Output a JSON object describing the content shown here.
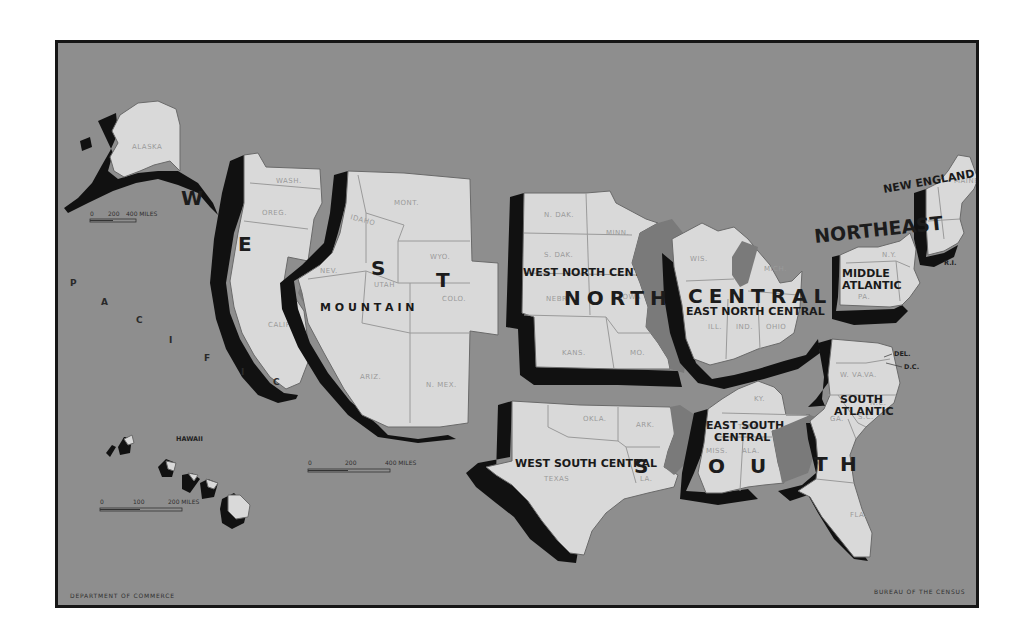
{
  "map": {
    "regions": {
      "west": {
        "label_letters": [
          "W",
          "E",
          "S",
          "T"
        ]
      },
      "north_central": {
        "label_word1": "NORTH",
        "label_word2": "CENTRAL"
      },
      "northeast": {
        "label": "NORTHEAST"
      },
      "south": {
        "label_letters": [
          "S",
          "O",
          "U",
          "T",
          "H"
        ]
      }
    },
    "divisions": {
      "mountain": "M O U N T A I N",
      "pacific_letters": [
        "P",
        "A",
        "C",
        "I",
        "F",
        "I",
        "C"
      ],
      "west_north_central": "WEST NORTH CENTRAL",
      "east_north_central": "EAST NORTH CENTRAL",
      "new_england": "NEW ENGLAND",
      "middle_atlantic_line1": "MIDDLE",
      "middle_atlantic_line2": "ATLANTIC",
      "west_south_central": "WEST SOUTH CENTRAL",
      "east_south_central_line1": "EAST SOUTH",
      "east_south_central_line2": "CENTRAL",
      "south_atlantic_line1": "SOUTH",
      "south_atlantic_line2": "ATLANTIC"
    },
    "states": {
      "alaska": "ALASKA",
      "wash": "WASH.",
      "oreg": "OREG.",
      "calif": "CALIF.",
      "mont": "MONT.",
      "idaho": "IDAHO",
      "wyo": "WYO.",
      "nev": "NEV.",
      "utah": "UTAH",
      "colo": "COLO.",
      "ariz": "ARIZ.",
      "nmex": "N. MEX.",
      "ndak": "N. DAK.",
      "minn": "MINN.",
      "sdak": "S. DAK.",
      "nebr": "NEBR.",
      "iowa": "IOWA",
      "kans": "KANS.",
      "mo": "MO.",
      "wis": "WIS.",
      "mich": "MICH.",
      "ill": "ILL.",
      "ind": "IND.",
      "ohio": "OHIO",
      "ny": "N.Y.",
      "pa": "PA.",
      "nj": "N.J.",
      "maine": "MAINE",
      "ri": "R.I.",
      "okla": "OKLA.",
      "ark": "ARK.",
      "texas": "TEXAS",
      "la": "LA.",
      "ky": "KY.",
      "tenn": "TENN.",
      "miss": "MISS.",
      "ala": "ALA.",
      "va": "VA.",
      "wva": "W. VA.",
      "nc": "N.C.",
      "sc": "S.C.",
      "ga": "GA.",
      "fla": "FLA.",
      "del": "DEL.",
      "dc": "D.C.",
      "hawaii": "HAWAII"
    },
    "scales": {
      "alaska": {
        "ticks": [
          "0",
          "200",
          "400 MILES"
        ]
      },
      "conus": {
        "ticks": [
          "0",
          "200",
          "400 MILES"
        ]
      },
      "hawaii": {
        "ticks": [
          "0",
          "100",
          "200 MILES"
        ]
      }
    },
    "footer": {
      "left": "DEPARTMENT OF COMMERCE",
      "right": "BUREAU OF THE CENSUS"
    },
    "colors": {
      "background": "#8e8e8e",
      "land": "#d9d9d9",
      "shadow": "#111111",
      "frame": "#161616"
    }
  }
}
